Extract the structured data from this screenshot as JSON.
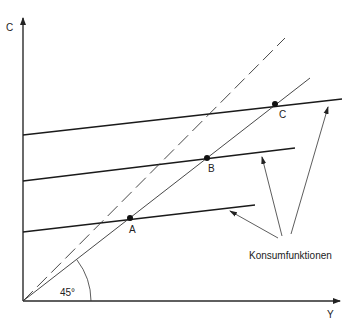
{
  "diagram": {
    "axes": {
      "y_label": "C",
      "x_label": "Y"
    },
    "angle_label": "45°",
    "points": [
      {
        "id": "A",
        "label": "A"
      },
      {
        "id": "B",
        "label": "B"
      },
      {
        "id": "C",
        "label": "C"
      }
    ],
    "consumption_functions_label": "Konsumfunktionen",
    "lines": [
      {
        "name": "consumption-function-1",
        "from": [
          23,
          135
        ],
        "to": [
          340,
          100
        ]
      },
      {
        "name": "consumption-function-2",
        "from": [
          23,
          181
        ],
        "to": [
          295,
          148
        ]
      },
      {
        "name": "consumption-function-3",
        "from": [
          23,
          232
        ],
        "to": [
          255,
          205
        ]
      },
      {
        "name": "45-degree-line",
        "style": "solid"
      },
      {
        "name": "dashed-line",
        "style": "dashed"
      }
    ]
  }
}
